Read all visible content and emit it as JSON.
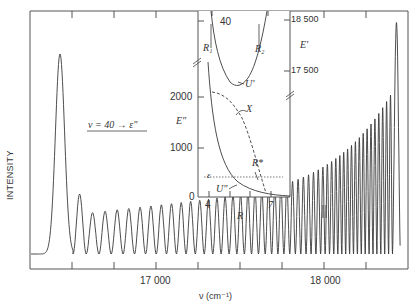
{
  "chart_data": [
    {
      "type": "line",
      "role": "main",
      "title": "",
      "xlabel": "ν (cm⁻¹)",
      "ylabel": "INTENSITY",
      "xlim": [
        16500,
        18500
      ],
      "xticks_major": [
        17000,
        18000
      ],
      "xtick_labels": [
        "17 000",
        "18 000"
      ],
      "xticks_minor_step": 250,
      "annotation": "v = 40 → ε\"",
      "break_marker": "||",
      "break_marker_x": 18000,
      "series": [
        {
          "name": "bound-free emission spectrum",
          "description": "Large initial peak near 16 670 cm⁻¹, then a long train of oscillations with increasing amplitude and decreasing spacing, climaxing in a sharp final peak near 18 420 cm⁻¹, then dropping to baseline",
          "x": [
            16550,
            16660,
            16720,
            16830,
            17000,
            17250,
            17500,
            17750,
            18000,
            18200,
            18300,
            18380,
            18420,
            18460
          ],
          "y": [
            0.03,
            0.78,
            0.0,
            0.23,
            0.19,
            0.19,
            0.2,
            0.22,
            0.32,
            0.45,
            0.6,
            0.75,
            0.93,
            0.03
          ]
        }
      ]
    },
    {
      "type": "line",
      "role": "inset",
      "title": "",
      "xlabel": "R",
      "xticks": [
        4,
        7
      ],
      "ylabel_left": "E\"",
      "ylabel_right": "E'",
      "yticks_left": [
        0,
        1000,
        2000
      ],
      "yticks_right": [
        17500,
        18500
      ],
      "extra_tick_label": "40",
      "series": [
        {
          "name": "U'",
          "style": "solid",
          "description": "upper-state potential well, minimum near E' ≈ 17 300"
        },
        {
          "name": "U\"",
          "style": "solid",
          "description": "repulsive lower-state potential decaying from ~2000 at R≈4 to 0 at R≈7.5"
        },
        {
          "name": "X",
          "style": "dashed",
          "description": "difference potential curve from ~2100 at R≈4 to 0 at R≈6.7"
        },
        {
          "name": "ε",
          "style": "dotted",
          "description": "horizontal energy level at E\" ≈ 420"
        }
      ],
      "annotations": [
        "R₁",
        "R₂",
        "R*",
        "U'",
        "U\"",
        "X",
        "ε"
      ]
    }
  ],
  "labels": {
    "ylabel": "INTENSITY",
    "xlabel": "ν (cm⁻¹)",
    "xtick_17000": "17 000",
    "xtick_18000": "18 000",
    "annotation_main": "v = 40 → ε\"",
    "inset_2000": "2000",
    "inset_1000": "1000",
    "inset_0": "0",
    "inset_E2": "E\"",
    "inset_E1": "E'",
    "inset_18500": "18 500",
    "inset_17500": "17 500",
    "inset_40": "40",
    "inset_R": "R",
    "inset_R4": "4",
    "inset_R7": "7",
    "R1": "R₁",
    "R2": "R₂",
    "Rstar": "R*",
    "U1": "U'",
    "U2": "U\"",
    "X": "X",
    "eps": "ε"
  },
  "colors": {
    "line": "#3a3a3a",
    "axis": "#555555",
    "background": "#ffffff"
  }
}
